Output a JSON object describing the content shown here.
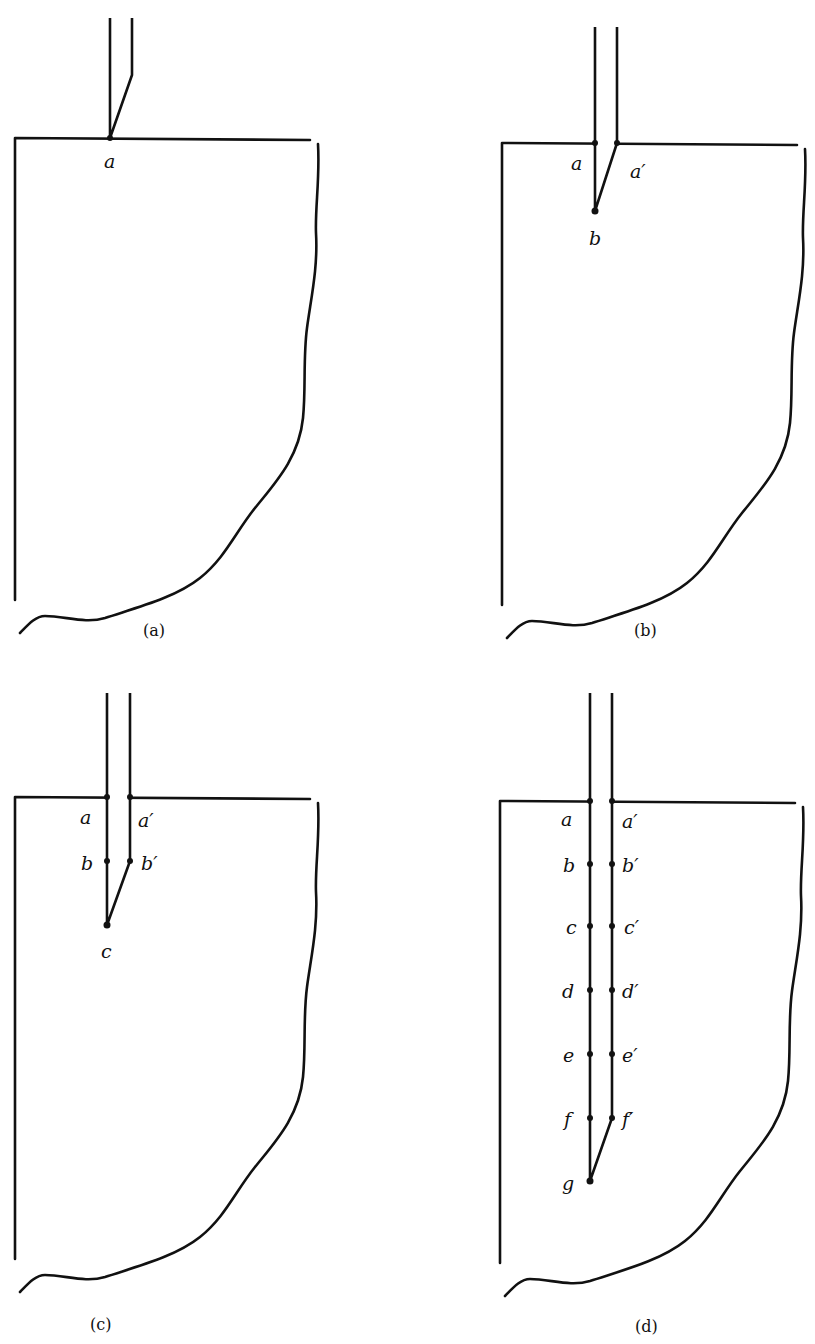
{
  "figure": {
    "panels": [
      {
        "id": "a",
        "caption": "(a)",
        "points": [
          {
            "label": "a"
          }
        ]
      },
      {
        "id": "b",
        "caption": "(b)",
        "points": [
          {
            "label": "a"
          },
          {
            "label": "a′"
          },
          {
            "label": "b"
          }
        ]
      },
      {
        "id": "c",
        "caption": "(c)",
        "points": [
          {
            "label": "a"
          },
          {
            "label": "a′"
          },
          {
            "label": "b"
          },
          {
            "label": "b′"
          },
          {
            "label": "c"
          }
        ]
      },
      {
        "id": "d",
        "caption": "(d)",
        "points": [
          {
            "label": "a"
          },
          {
            "label": "a′"
          },
          {
            "label": "b"
          },
          {
            "label": "b′"
          },
          {
            "label": "c"
          },
          {
            "label": "c′"
          },
          {
            "label": "d"
          },
          {
            "label": "d′"
          },
          {
            "label": "e"
          },
          {
            "label": "e′"
          },
          {
            "label": "f"
          },
          {
            "label": "f′"
          },
          {
            "label": "g"
          }
        ]
      }
    ]
  }
}
